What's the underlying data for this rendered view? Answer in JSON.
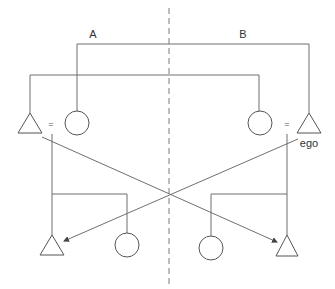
{
  "diagram": {
    "cut_caption": "",
    "moieties": [
      {
        "id": "A",
        "label": "A"
      },
      {
        "id": "B",
        "label": "B"
      }
    ],
    "ego_label": "ego",
    "marriage_symbol": "=",
    "nodes": [
      {
        "id": "m1",
        "kind": "male",
        "generation": 1,
        "moiety": "A"
      },
      {
        "id": "f1",
        "kind": "female",
        "generation": 1,
        "moiety": "A"
      },
      {
        "id": "f2",
        "kind": "female",
        "generation": 1,
        "moiety": "B"
      },
      {
        "id": "ego",
        "kind": "male",
        "generation": 1,
        "moiety": "B",
        "label": "ego"
      },
      {
        "id": "m3",
        "kind": "male",
        "generation": 2,
        "moiety": "A"
      },
      {
        "id": "f3",
        "kind": "female",
        "generation": 2,
        "moiety": "A"
      },
      {
        "id": "f4",
        "kind": "female",
        "generation": 2,
        "moiety": "B"
      },
      {
        "id": "m4",
        "kind": "male",
        "generation": 2,
        "moiety": "B"
      }
    ],
    "marriages": [
      [
        "m1",
        "f1"
      ],
      [
        "f2",
        "ego"
      ]
    ],
    "arrows": [
      {
        "from": "m1",
        "to": "m4"
      },
      {
        "from": "ego",
        "to": "m3"
      }
    ],
    "colors": {
      "line": "#6f6f6f",
      "text": "#333333"
    }
  }
}
